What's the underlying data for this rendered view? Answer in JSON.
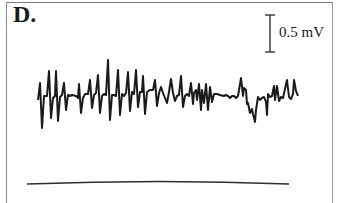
{
  "figure": {
    "panel_label": "D.",
    "scale_bar": {
      "label": "0.5 mV",
      "orientation": "vertical"
    },
    "trace": {
      "description": "Spontaneous electrical activity recording with repeated spikes",
      "color": "#1a1a1a"
    },
    "baseline": {
      "description": "Flat reference trace",
      "color": "#333333"
    }
  }
}
